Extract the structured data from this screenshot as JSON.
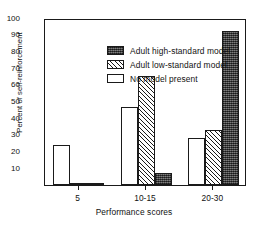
{
  "chart_data": {
    "type": "bar",
    "title": "",
    "xlabel": "Performance scores",
    "ylabel": "Percent of self-reinforcement",
    "categories": [
      "5",
      "10-15",
      "20-30"
    ],
    "ylim": [
      0,
      100
    ],
    "yticks": [
      0,
      10,
      20,
      30,
      40,
      50,
      60,
      70,
      80,
      90,
      100
    ],
    "ytick_labels": [
      "",
      "10",
      "20",
      "30",
      "40",
      "50",
      "60",
      "70",
      "80",
      "90",
      "100"
    ],
    "grid": false,
    "legend_position": "upper-left-inside",
    "series": [
      {
        "name": "No model present",
        "fill": "none",
        "values": [
          24,
          47,
          28
        ]
      },
      {
        "name": "Adult low-standard model",
        "fill": "hatch",
        "values": [
          1.5,
          65,
          33
        ]
      },
      {
        "name": "Adult high-standard model",
        "fill": "dark",
        "values": [
          1,
          7,
          92
        ]
      }
    ],
    "series_draw_order": [
      "No model present",
      "Adult low-standard model",
      "Adult high-standard model"
    ]
  },
  "colors": {
    "axis": "#1a1a1a",
    "dark_fill": "#4a4a4a",
    "background": "#ffffff"
  }
}
